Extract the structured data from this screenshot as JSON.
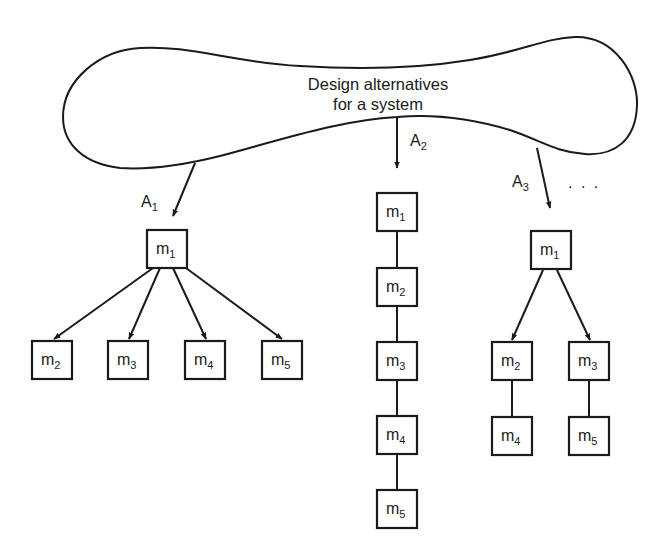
{
  "title": "Design alternatives for a system",
  "cloud": {
    "label_lines": [
      "Design alternatives",
      "for a system"
    ]
  },
  "alternatives": [
    {
      "label": "A",
      "subscript": "1",
      "structure": "tree: m1 -> m2, m3, m4, m5"
    },
    {
      "label": "A",
      "subscript": "2",
      "structure": "chain: m1 - m2 - m3 - m4 - m5"
    },
    {
      "label": "A",
      "subscript": "3",
      "structure": "tree: m1 -> m2, m3; m2 - m4; m3 - m5"
    }
  ],
  "ellipsis": ". . .",
  "modules": {
    "A1": [
      {
        "id": "m1",
        "base": "m",
        "sub": "1",
        "x": 147,
        "y": 230
      },
      {
        "id": "m2",
        "base": "m",
        "sub": "2",
        "x": 32,
        "y": 341
      },
      {
        "id": "m3",
        "base": "m",
        "sub": "3",
        "x": 108,
        "y": 341
      },
      {
        "id": "m4",
        "base": "m",
        "sub": "4",
        "x": 185,
        "y": 341
      },
      {
        "id": "m5",
        "base": "m",
        "sub": "5",
        "x": 262,
        "y": 341
      }
    ],
    "A2": [
      {
        "id": "m1",
        "base": "m",
        "sub": "1",
        "x": 377,
        "y": 193
      },
      {
        "id": "m2",
        "base": "m",
        "sub": "2",
        "x": 377,
        "y": 268
      },
      {
        "id": "m3",
        "base": "m",
        "sub": "3",
        "x": 377,
        "y": 342
      },
      {
        "id": "m4",
        "base": "m",
        "sub": "4",
        "x": 377,
        "y": 416
      },
      {
        "id": "m5",
        "base": "m",
        "sub": "5",
        "x": 377,
        "y": 490
      }
    ],
    "A3": [
      {
        "id": "m1",
        "base": "m",
        "sub": "1",
        "x": 531,
        "y": 231
      },
      {
        "id": "m2",
        "base": "m",
        "sub": "2",
        "x": 492,
        "y": 342
      },
      {
        "id": "m3",
        "base": "m",
        "sub": "3",
        "x": 569,
        "y": 342
      },
      {
        "id": "m4",
        "base": "m",
        "sub": "4",
        "x": 492,
        "y": 417
      },
      {
        "id": "m5",
        "base": "m",
        "sub": "5",
        "x": 569,
        "y": 417
      }
    ]
  },
  "colors": {
    "ink": "#1a1a1a",
    "background": "#ffffff"
  }
}
